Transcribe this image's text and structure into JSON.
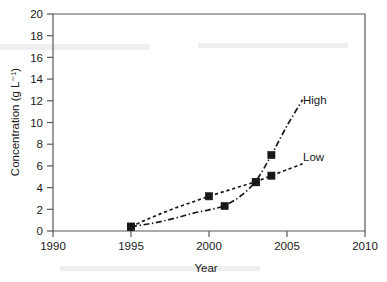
{
  "chart_data": {
    "type": "line",
    "title": "",
    "xlabel": "Year",
    "ylabel": "Concentration (g L⁻¹)",
    "xlim": [
      1990,
      2010
    ],
    "ylim": [
      0,
      20
    ],
    "xticks": [
      "1990",
      "1995",
      "2000",
      "2005",
      "2010"
    ],
    "yticks": [
      "0",
      "2",
      "4",
      "6",
      "8",
      "10",
      "12",
      "14",
      "16",
      "18",
      "20"
    ],
    "grid": false,
    "legend_position": "inline-right",
    "series": [
      {
        "name": "Low",
        "label": "Low",
        "linestyle": "dotted",
        "marker": "filled-square",
        "points": [
          {
            "x": 1995,
            "y": 0.4
          },
          {
            "x": 2000,
            "y": 3.2
          },
          {
            "x": 2003,
            "y": 4.5
          },
          {
            "x": 2004,
            "y": 5.1
          }
        ],
        "curve": [
          {
            "x": 1995,
            "y": 0.4
          },
          {
            "x": 1996,
            "y": 1.05
          },
          {
            "x": 1997,
            "y": 1.65
          },
          {
            "x": 1998,
            "y": 2.2
          },
          {
            "x": 1999,
            "y": 2.7
          },
          {
            "x": 2000,
            "y": 3.2
          },
          {
            "x": 2001,
            "y": 3.65
          },
          {
            "x": 2002,
            "y": 4.1
          },
          {
            "x": 2003,
            "y": 4.55
          },
          {
            "x": 2004,
            "y": 5.1
          },
          {
            "x": 2005,
            "y": 5.65
          },
          {
            "x": 2006,
            "y": 6.2
          }
        ]
      },
      {
        "name": "High",
        "label": "High",
        "linestyle": "dash-dot",
        "marker": "filled-square",
        "points": [
          {
            "x": 1995,
            "y": 0.4
          },
          {
            "x": 2001,
            "y": 2.3
          },
          {
            "x": 2003,
            "y": 4.5
          },
          {
            "x": 2004,
            "y": 7.0
          }
        ],
        "curve": [
          {
            "x": 1995,
            "y": 0.4
          },
          {
            "x": 1996,
            "y": 0.62
          },
          {
            "x": 1997,
            "y": 0.9
          },
          {
            "x": 1998,
            "y": 1.25
          },
          {
            "x": 1999,
            "y": 1.65
          },
          {
            "x": 2000,
            "y": 1.95
          },
          {
            "x": 2001,
            "y": 2.35
          },
          {
            "x": 2002,
            "y": 3.2
          },
          {
            "x": 2003,
            "y": 4.6
          },
          {
            "x": 2004,
            "y": 7.0
          },
          {
            "x": 2005,
            "y": 9.7
          },
          {
            "x": 2006,
            "y": 12.1
          }
        ]
      }
    ]
  }
}
